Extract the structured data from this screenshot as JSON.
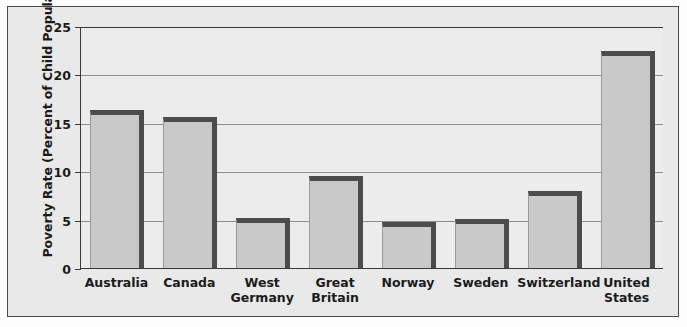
{
  "figure": {
    "y_axis_title": "Poverty Rate (Percent of Child Population)",
    "border_color": "#4a4a4a",
    "background_color": "#e9e9e9",
    "plot_background_color": "#ececec",
    "bar_fill_color": "#c9c9c9",
    "bar_edge_color": "#4c4c4c",
    "gridline_color": "#8d8d8d"
  },
  "chart_data": {
    "type": "bar",
    "title": "",
    "xlabel": "",
    "ylabel": "Poverty Rate (Percent of Child Population)",
    "ylim": [
      0,
      25
    ],
    "yticks": [
      0,
      5,
      10,
      15,
      20,
      25
    ],
    "ytick_labels": [
      "0",
      "5",
      "10",
      "15",
      "20",
      "25"
    ],
    "grid": true,
    "legend": false,
    "categories": [
      "Australia",
      "Canada",
      "West Germany",
      "Great Britain",
      "Norway",
      "Sweden",
      "Switzerland",
      "United States"
    ],
    "category_label_lines": [
      [
        "Australia"
      ],
      [
        "Canada"
      ],
      [
        "West",
        "Germany"
      ],
      [
        "Great",
        "Britain"
      ],
      [
        "Norway"
      ],
      [
        "Sweden"
      ],
      [
        "Switzerland"
      ],
      [
        "United",
        "States"
      ]
    ],
    "values": [
      16.3,
      15.6,
      5.2,
      9.5,
      4.8,
      5.1,
      8.0,
      22.4
    ]
  }
}
